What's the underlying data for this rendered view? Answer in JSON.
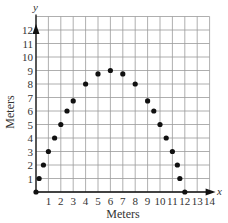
{
  "chart_data": {
    "type": "scatter",
    "title": "",
    "xlabel": "Meters",
    "ylabel": "Meters",
    "x_axis_name": "x",
    "y_axis_name": "y",
    "xlim": [
      0,
      14
    ],
    "ylim": [
      0,
      13
    ],
    "grid": true,
    "x_ticks": [
      "1",
      "2",
      "3",
      "4",
      "5",
      "6",
      "7",
      "8",
      "9",
      "10",
      "11",
      "12",
      "13",
      "14"
    ],
    "y_ticks": [
      "1",
      "2",
      "3",
      "4",
      "5",
      "6",
      "7",
      "8",
      "9",
      "10",
      "11",
      "12"
    ],
    "series": [
      {
        "name": "points",
        "x": [
          0,
          0.25,
          0.6,
          1,
          1.5,
          2,
          2.5,
          3,
          4,
          5,
          6,
          7,
          8,
          9,
          9.5,
          10,
          10.5,
          11,
          11.4,
          11.6,
          12
        ],
        "y": [
          0,
          1,
          2,
          3,
          4,
          5,
          6,
          6.75,
          8,
          8.75,
          9,
          8.75,
          8,
          6.75,
          6,
          5,
          4,
          3,
          2,
          1,
          0
        ]
      }
    ],
    "colors": {
      "grid": "#9a9a9a",
      "axis": "#111111",
      "point": "#111111"
    }
  }
}
